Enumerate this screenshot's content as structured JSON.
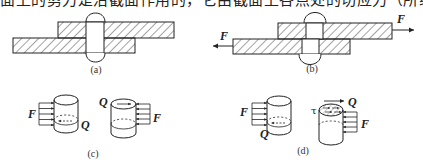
{
  "header_text": "面上的剪力是沿截面作用的，它由截面上各点处的切应力（所组成）",
  "figures": {
    "a": {
      "label": "(a)",
      "description": "riveted lap joint, unloaded"
    },
    "b": {
      "label": "(b)",
      "description": "riveted lap joint under tension",
      "force_left": "F",
      "force_right": "F"
    },
    "c": {
      "label": "(c)",
      "left_force": "F",
      "left_shear": "Q",
      "right_force": "F",
      "right_shear": "Q"
    },
    "d": {
      "label": "(d)",
      "left_force": "F",
      "left_shear": "Q",
      "right_force": "F",
      "right_shear": "Q",
      "stress_symbol": "τ"
    }
  },
  "colors": {
    "line": "#222222",
    "hatch": "#333333",
    "background": "#ffffff"
  }
}
